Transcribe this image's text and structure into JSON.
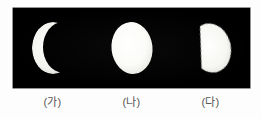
{
  "figure": {
    "background_color": "#fdfdfd",
    "panel_color": "#000000",
    "moon_color": "#f6f6f4",
    "label_color": "#555555",
    "panel": {
      "x": 13,
      "y": 8,
      "width": 237,
      "height": 80
    }
  },
  "moons": [
    {
      "key": "moon-a",
      "label": "(가)",
      "phase_name": "crescent",
      "description": "thin crescent, illuminated limb on the left, horns opening to the right",
      "illuminated_fraction": 0.18,
      "lit_side": "left",
      "center": {
        "x": 48,
        "y": 48
      },
      "radius_x": 21,
      "radius_y": 26
    },
    {
      "key": "moon-b",
      "label": "(나)",
      "phase_name": "full",
      "description": "full round moon, slightly elliptical disk",
      "illuminated_fraction": 1.0,
      "lit_side": "full",
      "center": {
        "x": 128,
        "y": 48
      },
      "radius_x": 21,
      "radius_y": 26
    },
    {
      "key": "moon-c",
      "label": "(다)",
      "phase_name": "gibbous-half",
      "description": "half-lit moon, straight terminator running diagonally, bright portion toward the lower right",
      "illuminated_fraction": 0.5,
      "lit_side": "right",
      "center": {
        "x": 212,
        "y": 48
      },
      "radius_x": 20,
      "radius_y": 25
    }
  ]
}
